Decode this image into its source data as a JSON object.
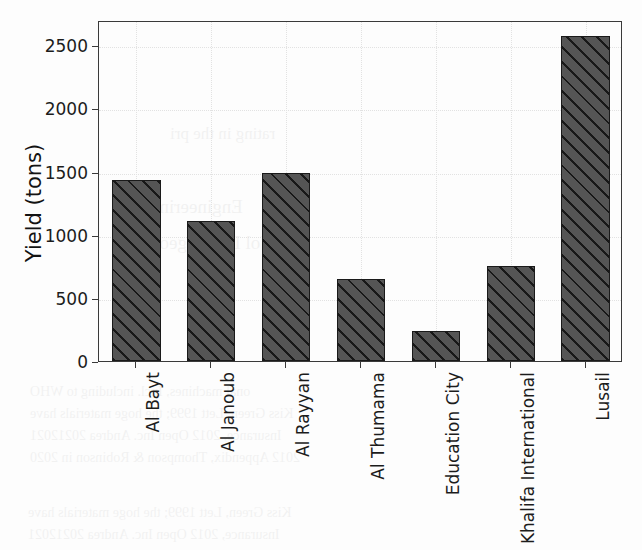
{
  "chart_data": {
    "type": "bar",
    "title": "",
    "xlabel": "",
    "ylabel": "Yield (tons)",
    "categories": [
      "Al Bayt",
      "Al Janoub",
      "Al Rayyan",
      "Al Thumama",
      "Education City",
      "Khalifa International",
      "Lusail"
    ],
    "values": [
      1430,
      1110,
      1490,
      650,
      235,
      755,
      2570
    ],
    "ylim": [
      0,
      2700
    ],
    "yticks": [
      0,
      500,
      1000,
      1500,
      2000,
      2500
    ],
    "ytick_labels": [
      "0",
      "500",
      "1000",
      "1500",
      "2000",
      "2500"
    ],
    "grid": true,
    "legend": false,
    "bar_color": "#555555",
    "bar_edge_color": "#1a1a1a",
    "bar_hatch": "diagonal-forward-slash",
    "grid_color": "#e2e2e2",
    "axis_color": "#3a3a3a"
  },
  "background_text": {
    "note": "faint mirrored scanned-page bleed-through, illegible",
    "lines": [
      "rating in the pri",
      "Engineering",
      "de Nol Lagrangeon",
      "onal machines, Incl. including to WHO",
      "Kiss Green, Lett 1999; the hoge materials have",
      "Insurance, 2012 Open Inc. Andrea 20212021",
      "2012 Appendix, Thompson & Robinson in 2020"
    ]
  }
}
